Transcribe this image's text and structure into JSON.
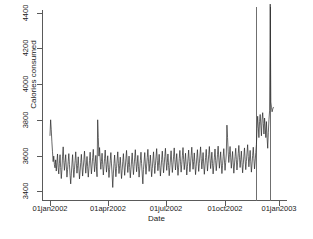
{
  "chart_data": {
    "type": "line",
    "title": "",
    "xlabel": "Date",
    "ylabel": "Calories consumed",
    "grid": false,
    "legend": "none",
    "xlim": [
      "01jan2002",
      "08jan2003"
    ],
    "ylim": [
      3350,
      4450
    ],
    "ytick_labels": [
      "3400",
      "3600",
      "3800",
      "4000",
      "4200",
      "4400"
    ],
    "ytick_values": [
      3400,
      3600,
      3800,
      4000,
      4200,
      4400
    ],
    "xtick_labels": [
      "01jan2002",
      "01apr2002",
      "01jul2002",
      "01oct2002",
      "01jan2003"
    ],
    "xtick_values": [
      0,
      90,
      181,
      273,
      365
    ],
    "annotations": [
      {
        "name": "reference-line-1",
        "x_index": 330,
        "label": ""
      },
      {
        "name": "reference-line-2",
        "x_index": 351,
        "label": ""
      }
    ],
    "series": [
      {
        "name": "Calories consumed",
        "color": "#262626",
        "x_start_label": "01jan2002",
        "x_unit": "day",
        "values": [
          3712,
          3800,
          3744,
          3676,
          3620,
          3565,
          3596,
          3548,
          3530,
          3575,
          3512,
          3560,
          3608,
          3530,
          3496,
          3556,
          3604,
          3532,
          3470,
          3520,
          3596,
          3648,
          3570,
          3516,
          3560,
          3604,
          3540,
          3478,
          3520,
          3566,
          3610,
          3548,
          3488,
          3440,
          3496,
          3552,
          3604,
          3534,
          3476,
          3522,
          3570,
          3620,
          3556,
          3500,
          3544,
          3592,
          3528,
          3468,
          3512,
          3560,
          3606,
          3540,
          3484,
          3530,
          3576,
          3624,
          3558,
          3500,
          3546,
          3594,
          3536,
          3478,
          3524,
          3572,
          3618,
          3552,
          3496,
          3540,
          3588,
          3634,
          3566,
          3508,
          3552,
          3600,
          3536,
          3480,
          3800,
          3700,
          3596,
          3644,
          3580,
          3522,
          3566,
          3612,
          3548,
          3490,
          3536,
          3584,
          3630,
          3564,
          3506,
          3550,
          3598,
          3534,
          3476,
          3522,
          3570,
          3616,
          3552,
          3494,
          3420,
          3496,
          3554,
          3602,
          3538,
          3480,
          3526,
          3574,
          3620,
          3556,
          3498,
          3542,
          3590,
          3528,
          3470,
          3516,
          3564,
          3610,
          3546,
          3488,
          3534,
          3582,
          3628,
          3562,
          3504,
          3548,
          3596,
          3532,
          3474,
          3520,
          3568,
          3614,
          3550,
          3492,
          3538,
          3586,
          3632,
          3566,
          3508,
          3552,
          3600,
          3536,
          3478,
          3524,
          3572,
          3618,
          3554,
          3496,
          3440,
          3520,
          3568,
          3616,
          3552,
          3494,
          3540,
          3588,
          3634,
          3568,
          3510,
          3554,
          3602,
          3538,
          3480,
          3526,
          3574,
          3620,
          3556,
          3498,
          3544,
          3592,
          3638,
          3572,
          3514,
          3558,
          3606,
          3542,
          3484,
          3530,
          3578,
          3624,
          3560,
          3502,
          3546,
          3594,
          3640,
          3574,
          3516,
          3560,
          3608,
          3544,
          3486,
          3532,
          3580,
          3626,
          3562,
          3504,
          3548,
          3596,
          3642,
          3576,
          3518,
          3562,
          3610,
          3546,
          3488,
          3534,
          3582,
          3628,
          3564,
          3506,
          3550,
          3598,
          3644,
          3578,
          3520,
          3564,
          3612,
          3548,
          3490,
          3536,
          3584,
          3630,
          3566,
          3508,
          3552,
          3600,
          3646,
          3580,
          3522,
          3566,
          3614,
          3550,
          3492,
          3538,
          3586,
          3632,
          3568,
          3510,
          3554,
          3602,
          3648,
          3582,
          3524,
          3568,
          3616,
          3552,
          3494,
          3540,
          3588,
          3634,
          3570,
          3512,
          3556,
          3604,
          3650,
          3584,
          3526,
          3570,
          3618,
          3554,
          3496,
          3542,
          3590,
          3636,
          3572,
          3514,
          3558,
          3606,
          3652,
          3586,
          3528,
          3572,
          3620,
          3556,
          3498,
          3544,
          3592,
          3638,
          3574,
          3516,
          3560,
          3608,
          3770,
          3700,
          3620,
          3560,
          3604,
          3650,
          3586,
          3528,
          3574,
          3622,
          3558,
          3500,
          3546,
          3594,
          3640,
          3576,
          3518,
          3562,
          3610,
          3656,
          3590,
          3532,
          3576,
          3624,
          3560,
          3502,
          3548,
          3596,
          3642,
          3578,
          3520,
          3566,
          3614,
          3660,
          3594,
          3536,
          3580,
          3628,
          3564,
          3506,
          3552,
          3600,
          3646,
          3582,
          3524,
          3568,
          3616,
          3662,
          3750,
          3820,
          3760,
          3700,
          3790,
          3830,
          3770,
          3710,
          3800,
          3840,
          3780,
          3720,
          3810,
          3760,
          3700,
          3790,
          3700,
          3640,
          3730,
          3800,
          3850,
          4450,
          3900,
          3870,
          3845,
          3860,
          3870
        ]
      }
    ]
  },
  "axis": {
    "y_title": "Calories consumed",
    "x_title": "Date"
  }
}
